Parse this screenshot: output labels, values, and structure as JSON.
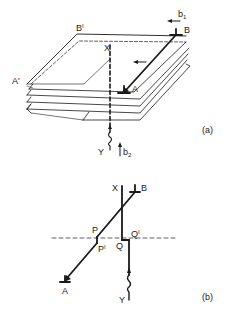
{
  "figure": {
    "panel_a": {
      "label": "(a)",
      "points": {
        "B_prime": "B",
        "B_prime_sup": "I",
        "A_prime": "A'",
        "X": "X",
        "B": "B",
        "A": "A",
        "Y": "Y"
      },
      "vectors": {
        "b1": "b",
        "b1_sub": "1",
        "b2": "b",
        "b2_sub": "2"
      },
      "plate_count": 5
    },
    "panel_b": {
      "label": "(b)",
      "points": {
        "X": "X",
        "B": "B",
        "P": "P",
        "P_prime": "P",
        "P_prime_sup": "I",
        "Q": "Q",
        "Q_prime": "Q",
        "Q_prime_sup": "I",
        "A": "A",
        "Y": "Y"
      }
    },
    "colors": {
      "line": "#1a1a1a",
      "background": "#ffffff"
    }
  }
}
